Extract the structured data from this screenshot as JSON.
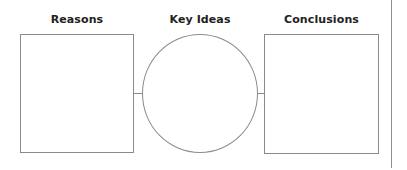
{
  "diagram": {
    "type": "graphic-organizer",
    "columns": [
      {
        "id": "reasons",
        "title": "Reasons",
        "shape": "rectangle",
        "content": ""
      },
      {
        "id": "key_ideas",
        "title": "Key Ideas",
        "shape": "circle",
        "content": ""
      },
      {
        "id": "conclusions",
        "title": "Conclusions",
        "shape": "rectangle",
        "content": ""
      }
    ],
    "connectors": [
      {
        "from": "reasons",
        "to": "key_ideas"
      },
      {
        "from": "key_ideas",
        "to": "conclusions"
      }
    ],
    "colors": {
      "stroke": "#8a8a8a",
      "text": "#222222",
      "background": "#ffffff"
    }
  }
}
